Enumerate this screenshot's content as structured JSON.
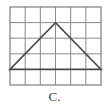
{
  "figure": {
    "label": "C.",
    "caption_color": "#3b3b3b"
  },
  "grid": {
    "columns": 6,
    "rows": 5,
    "left": 10,
    "top": 7,
    "right": 101,
    "bottom": 85,
    "cell_width": 15.1667,
    "cell_height": 15.6,
    "line_color": "#8a8a8a",
    "border_color": "#7d7d7d",
    "line_width": 1,
    "border_width": 1.2,
    "x_lines": [
      10,
      25.17,
      40.33,
      55.5,
      70.67,
      85.83,
      101
    ],
    "y_lines": [
      7,
      22.6,
      38.2,
      53.8,
      69.4,
      85
    ]
  },
  "shape": {
    "type": "triangle",
    "name": "isosceles-triangle",
    "stroke_color": "#4a4a4a",
    "stroke_width": 1.6,
    "fill": "none",
    "vertices": [
      {
        "name": "left-base-vertex",
        "x": 10,
        "y": 69.4,
        "grid_col": 0,
        "grid_row": 4
      },
      {
        "name": "apex-vertex",
        "x": 55.5,
        "y": 22.6,
        "grid_col": 3,
        "grid_row": 1
      },
      {
        "name": "right-base-vertex",
        "x": 101,
        "y": 69.4,
        "grid_col": 6,
        "grid_row": 4
      }
    ],
    "points_attr": "10,69.4 55.5,22.6 101,69.4",
    "base_length_cells": 6,
    "height_cells": 3
  },
  "canvas": {
    "width": 109,
    "height": 107,
    "background": "#ffffff"
  }
}
